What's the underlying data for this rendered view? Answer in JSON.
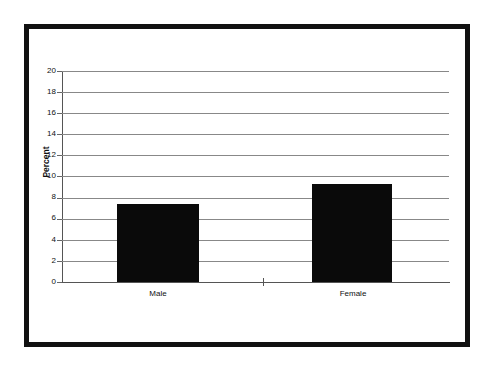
{
  "chart_data": {
    "type": "bar",
    "title": "",
    "subtitle": "",
    "xlabel": "",
    "ylabel": "Percent",
    "categories": [
      "Male",
      "Female"
    ],
    "values": [
      7.4,
      9.3
    ],
    "series": [
      {
        "name": "Percent",
        "values": [
          7.4,
          9.3
        ]
      }
    ],
    "ylim": [
      0,
      20
    ],
    "ytick_step": 2,
    "yticks": [
      20,
      18,
      16,
      14,
      12,
      10,
      8,
      6,
      4,
      2,
      0
    ],
    "ytick_labels": [
      "20",
      "18",
      "16",
      "14",
      "12",
      "10",
      "8",
      "6",
      "4",
      "2",
      "0"
    ],
    "grid": true,
    "grid_axis": "y",
    "legend": false,
    "legend_position": "none",
    "bar_color": "#0a0a0a",
    "gridline_color": "#888888",
    "axis_color": "#555555",
    "background_color": "#ffffff",
    "frame_color": "#111111",
    "annotations": []
  },
  "figure": {
    "frame_border_width": "5px",
    "has_outer_frame": true
  }
}
